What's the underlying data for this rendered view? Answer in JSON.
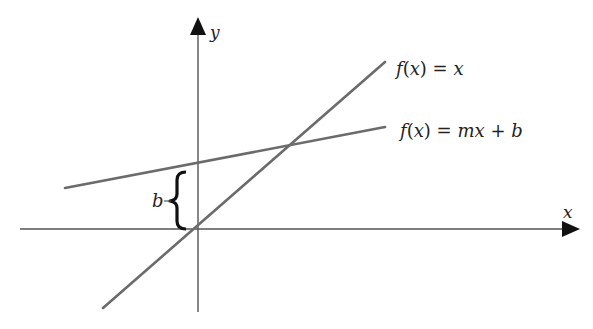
{
  "diagram": {
    "type": "linear-function-graph",
    "colors": {
      "axis": "#555555",
      "line": "#6b6b6b",
      "text": "#222222",
      "background": "#ffffff"
    },
    "axes": {
      "x_label": "x",
      "y_label": "y"
    },
    "lines": [
      {
        "id": "identity",
        "label": "f(x) = x",
        "label_parts": [
          "f",
          "(",
          "x",
          ")",
          " = ",
          "x"
        ]
      },
      {
        "id": "linear",
        "label": "f(x) = mx + b",
        "label_parts": [
          "f",
          "(",
          "x",
          ")",
          " = ",
          "mx",
          " + ",
          "b"
        ]
      }
    ],
    "annotations": {
      "intercept_label": "b",
      "intercept_description": "brace marking y-intercept distance b"
    }
  }
}
